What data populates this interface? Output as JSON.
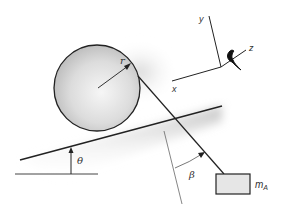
{
  "diagram": {
    "labels": {
      "radius": "r",
      "incline_angle": "θ",
      "cord_angle": "β",
      "mass": "m",
      "mass_subscript": "A",
      "axis_x": "x",
      "axis_y": "y",
      "axis_z": "z"
    },
    "colors": {
      "line": "#222222",
      "cylinder_fill_light": "#f4f4f4",
      "cylinder_fill_dark": "#bdbdbd",
      "block_fill": "#e6e6e6",
      "shadow": "#c8c8c8",
      "thin_line": "#555555"
    }
  }
}
